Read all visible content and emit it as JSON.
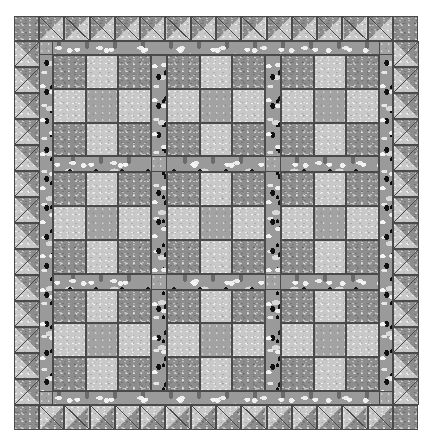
{
  "artwork": {
    "title": "Nine-Patch Sashed Quilt with Sawtooth Border",
    "kind": "quilt-block-diagram",
    "canvas": {
      "width": 432,
      "height": 446,
      "background": "#ffffff"
    }
  },
  "fabrics": [
    {
      "id": "dark",
      "name": "medium-dark speckled gray solid",
      "hex": "#8d8d8d"
    },
    {
      "id": "light",
      "name": "light speckled gray solid",
      "hex": "#c8c8c8"
    },
    {
      "id": "mid",
      "name": "medium gray solid",
      "hex": "#a2a2a2"
    },
    {
      "id": "print",
      "name": "high-contrast black-and-white mottled print",
      "hex": "#9a9a9a"
    }
  ],
  "geometry": {
    "margin_left": 14,
    "margin_top": 16,
    "quilt_width": 404,
    "quilt_height": 414,
    "border_width": 25,
    "sawtooth_unit": 25,
    "inner_sash_width": 14,
    "block_size": 104,
    "block_cell": 34,
    "sash_width": 16,
    "grid_rows": 3,
    "grid_cols": 3,
    "seam_color": "#4a4a4a"
  },
  "border": {
    "name": "sawtooth half-square-triangle border",
    "corner_fabric": "dark",
    "triangle_dark": "dark",
    "triangle_light": "light",
    "top_units": 14,
    "bottom_units": 14,
    "left_units": 14,
    "right_units": 14,
    "top_orientation": "dark-upper-left",
    "bottom_orientation": "light-upper-left",
    "left_orientation": "dark-upper-right",
    "right_orientation": "light-upper-right"
  },
  "inner_frame": {
    "name": "printed inner sashing frame",
    "fabric": "print",
    "cornerstone_fabric": "mid"
  },
  "block": {
    "name": "nine-patch",
    "cells": [
      [
        "dark",
        "light",
        "dark"
      ],
      [
        "light",
        "mid",
        "light"
      ],
      [
        "dark",
        "light",
        "dark"
      ]
    ],
    "count": 9
  },
  "sashing": {
    "fabric": "print",
    "cornerstone_fabric": "mid",
    "vertical_strips": 2,
    "horizontal_strips": 2
  }
}
